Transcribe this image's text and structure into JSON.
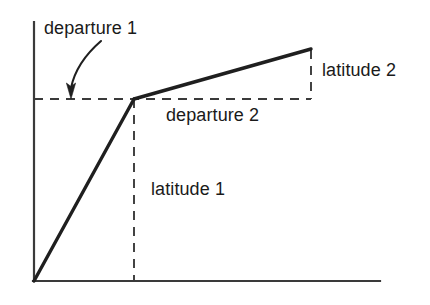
{
  "figure": {
    "background_color": "#ffffff",
    "stroke_color": "#1f1f1f",
    "axis_color": "#3a3a3a",
    "dash_color": "#3a3a3a",
    "text_color": "#1a1a1a",
    "labels": {
      "departure_1": "departure 1",
      "departure_2": "departure 2",
      "latitude_1": "latitude 1",
      "latitude_2": "latitude 2"
    },
    "axes": {
      "y_axis": {
        "x": 34,
        "y_top": 22,
        "y_bottom": 281
      },
      "x_axis": {
        "y": 281,
        "x_left": 34,
        "x_right": 380
      }
    },
    "traverse": {
      "origin": {
        "x": 34,
        "y": 281
      },
      "vertex": {
        "x": 134,
        "y": 99
      },
      "endpoint": {
        "x": 311,
        "y": 49
      }
    },
    "guides": {
      "horizontal_dashed": {
        "y": 99,
        "x_start": 34,
        "x_end": 311
      },
      "vertical_dashed_latitude_1": {
        "x": 134,
        "y_start": 99,
        "y_end": 281
      },
      "vertical_dashed_latitude_2": {
        "x": 311,
        "y_start": 49,
        "y_end": 99
      }
    },
    "annotation_arrow": {
      "name": "departure-1-arrow",
      "start": {
        "x": 101,
        "y": 41
      },
      "tip": {
        "x": 71,
        "y": 97
      }
    }
  }
}
